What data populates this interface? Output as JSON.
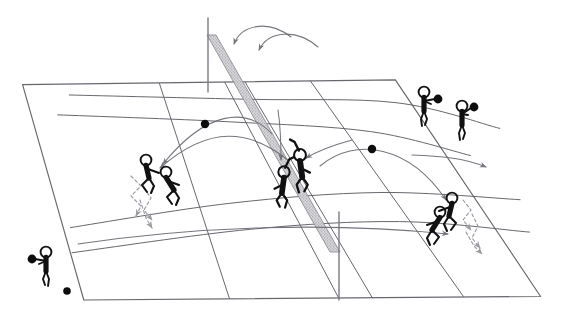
{
  "diagram": {
    "style": "hand-drawn pen sketch, perspective court",
    "canvas": {
      "width": 562,
      "height": 310
    },
    "colors": {
      "background": "#ffffff",
      "court_line": "#5a5a62",
      "net_band": "#b8b8bd",
      "net_band_edge": "#8a8a90",
      "figure": "#111111",
      "ball": "#0d0d0d",
      "trajectory": "#6e6e76",
      "dashed_move": "#9a9aa2",
      "post": "#7a7a82"
    }
  },
  "court": {
    "name": "volleyball-court",
    "outline": [
      [
        22,
        84
      ],
      [
        396,
        80
      ],
      [
        540,
        297
      ],
      [
        84,
        300
      ]
    ],
    "lines": [
      {
        "name": "court-outline",
        "points": [
          [
            22,
            84
          ],
          [
            396,
            80
          ],
          [
            540,
            297
          ],
          [
            84,
            300
          ]
        ],
        "closed": true,
        "width": 1.15
      },
      {
        "name": "sideline-far-left-third",
        "points": [
          [
            160,
            83
          ],
          [
            229,
            299
          ]
        ],
        "closed": false,
        "width": 1.0
      },
      {
        "name": "centre-cross-line-a",
        "points": [
          [
            225,
            82
          ],
          [
            339,
            298
          ]
        ],
        "closed": false,
        "width": 1.0
      },
      {
        "name": "centre-cross-line-b",
        "points": [
          [
            245,
            82
          ],
          [
            373,
            298
          ]
        ],
        "closed": false,
        "width": 1.0
      },
      {
        "name": "attack-line-right",
        "points": [
          [
            310,
            81
          ],
          [
            463,
            297
          ]
        ],
        "closed": false,
        "width": 1.0
      },
      {
        "name": "back-boundary-curve",
        "points": [
          [
            70,
            95
          ],
          [
            250,
            99
          ],
          [
            396,
            102
          ],
          [
            500,
            129
          ]
        ],
        "closed": false,
        "width": 1.0
      },
      {
        "name": "attack-line-upper-curve",
        "points": [
          [
            58,
            115
          ],
          [
            230,
            122
          ],
          [
            370,
            131
          ],
          [
            470,
            155
          ]
        ],
        "closed": false,
        "width": 1.0
      },
      {
        "name": "attack-line-lower-curve",
        "points": [
          [
            72,
            253
          ],
          [
            250,
            230
          ],
          [
            400,
            221
          ],
          [
            530,
            232
          ]
        ],
        "closed": false,
        "width": 1.0
      },
      {
        "name": "mid-sweep-curve",
        "points": [
          [
            70,
            228
          ],
          [
            230,
            203
          ],
          [
            380,
            192
          ],
          [
            520,
            200
          ]
        ],
        "closed": false,
        "width": 1.0
      }
    ]
  },
  "net": {
    "name": "volleyball-net",
    "band": {
      "points": [
        [
          207,
          35
        ],
        [
          216,
          35
        ],
        [
          340,
          252
        ],
        [
          330,
          252
        ]
      ],
      "fill": "#c2c2c6",
      "stipple": true
    },
    "posts": [
      {
        "name": "net-post-far",
        "points": [
          [
            208,
            18
          ],
          [
            208,
            92
          ]
        ],
        "width": 1.4
      },
      {
        "name": "net-post-near",
        "points": [
          [
            339,
            212
          ],
          [
            339,
            300
          ]
        ],
        "width": 1.4
      }
    ]
  },
  "balls": [
    {
      "name": "ball-left-arc",
      "cx": 205,
      "cy": 124,
      "r": 4.2
    },
    {
      "name": "ball-right-arc",
      "cx": 372,
      "cy": 149,
      "r": 4.2
    },
    {
      "name": "ball-floor-corner",
      "cx": 67,
      "cy": 291,
      "r": 3.8
    }
  ],
  "trajectories": [
    {
      "name": "trajectory-over-net-inner",
      "path": "M 291,37 C 268,19 241,25 234,44",
      "arrow_at": "end",
      "arrow_dir": "left"
    },
    {
      "name": "trajectory-over-net-outer",
      "path": "M 318,47 C 296,28 268,31 259,50",
      "arrow_at": "end",
      "arrow_dir": "left"
    },
    {
      "name": "trajectory-left-receive-arc",
      "path": "M 272,134 C 246,106 206,111 163,164",
      "arrow_at": "end",
      "arrow_dir": "down-left"
    },
    {
      "name": "trajectory-left-long-arc",
      "path": "M 288,160 C 250,130 210,124 160,168",
      "arrow_at": "end",
      "arrow_dir": "left"
    },
    {
      "name": "trajectory-right-receive-arc",
      "path": "M 320,166 C 356,136 410,146 446,200",
      "arrow_at": "end",
      "arrow_dir": "down-right"
    },
    {
      "name": "trajectory-right-flat",
      "path": "M 78,244 C 200,226 330,222 448,234",
      "arrow_at": "end",
      "arrow_dir": "right"
    },
    {
      "name": "trajectory-right-into-corner",
      "path": "M 412,155 C 440,156 464,158 486,167",
      "arrow_at": "end",
      "arrow_dir": "right"
    },
    {
      "name": "trajectory-net-drop",
      "path": "M 278,110 C 281,130 281,146 281,160",
      "arrow_at": "end",
      "arrow_dir": "down"
    },
    {
      "name": "trajectory-to-net-from-right",
      "path": "M 352,140 C 330,146 316,152 306,158",
      "arrow_at": "end",
      "arrow_dir": "left"
    }
  ],
  "movement_arrows": [
    {
      "name": "move-dashed-left-zigzag-a",
      "path": "M 131,176 L 141,186 L 131,196 L 141,206 L 136,216",
      "arrow": true
    },
    {
      "name": "move-dashed-left-zigzag-b",
      "path": "M 144,188 L 151,198 L 144,210 L 152,220",
      "arrow": true
    },
    {
      "name": "move-dashed-left-down",
      "path": "M 140,200 L 146,218 L 152,228",
      "arrow": true
    },
    {
      "name": "move-dashed-right-zigzag-a",
      "path": "M 463,200 L 471,210 L 463,220 L 471,230",
      "arrow": true
    },
    {
      "name": "move-dashed-right-zigzag-b",
      "path": "M 472,214 L 478,226 L 472,238 L 480,248",
      "arrow": true
    },
    {
      "name": "move-dashed-right-down",
      "path": "M 466,232 L 474,246 L 482,254",
      "arrow": true
    }
  ],
  "players": [
    {
      "name": "player-server-left-baseline",
      "role": "server",
      "x": 46,
      "y": 252,
      "scale": 1.0,
      "pose": "standing-holding-ball",
      "has_ball": true,
      "facing": "right"
    },
    {
      "name": "player-left-back-a",
      "role": "defender",
      "x": 146,
      "y": 160,
      "scale": 1.0,
      "pose": "crouch-ready",
      "has_ball": false,
      "facing": "right"
    },
    {
      "name": "player-left-back-b",
      "role": "defender",
      "x": 166,
      "y": 172,
      "scale": 1.0,
      "pose": "crouch-dig",
      "has_ball": false,
      "facing": "right"
    },
    {
      "name": "player-net-attacker",
      "role": "attacker",
      "x": 300,
      "y": 155,
      "scale": 1.1,
      "pose": "jump-arm-raised",
      "has_ball": false,
      "facing": "left"
    },
    {
      "name": "player-net-blocker",
      "role": "blocker",
      "x": 284,
      "y": 172,
      "scale": 1.05,
      "pose": "jump-arm-raised",
      "has_ball": false,
      "facing": "right"
    },
    {
      "name": "player-right-back-a",
      "role": "defender",
      "x": 452,
      "y": 198,
      "scale": 1.0,
      "pose": "crouch-ready",
      "has_ball": false,
      "facing": "left"
    },
    {
      "name": "player-right-back-b",
      "role": "defender",
      "x": 440,
      "y": 212,
      "scale": 1.0,
      "pose": "crouch-dig",
      "has_ball": false,
      "facing": "left"
    },
    {
      "name": "player-far-right-corner",
      "role": "attacker",
      "x": 424,
      "y": 92,
      "scale": 1.0,
      "pose": "standing-holding-ball",
      "has_ball": true,
      "facing": "left"
    },
    {
      "name": "player-outside-right-ball-holder",
      "role": "server",
      "x": 462,
      "y": 106,
      "scale": 1.0,
      "pose": "standing-holding-ball-high",
      "has_ball": true,
      "facing": "left"
    }
  ]
}
